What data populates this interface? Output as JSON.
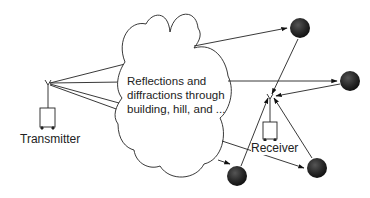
{
  "diagram": {
    "cloud_text": {
      "line1": "Reflections and",
      "line2": "diffractions through",
      "line3": "building, hill, and ..."
    },
    "transmitter_label": "Transmitter",
    "receiver_label": "Receiver",
    "nodes": [
      {
        "id": "transmitter",
        "label": "Transmitter",
        "type": "antenna-unit"
      },
      {
        "id": "cloud",
        "label": "Reflections and diffractions through building, hill, and ...",
        "type": "cloud"
      },
      {
        "id": "scatterer-1",
        "type": "dark-circle"
      },
      {
        "id": "scatterer-2",
        "type": "dark-circle"
      },
      {
        "id": "scatterer-3",
        "type": "dark-circle"
      },
      {
        "id": "scatterer-4",
        "type": "dark-circle"
      },
      {
        "id": "receiver",
        "label": "Receiver",
        "type": "antenna-unit"
      }
    ],
    "edges": [
      {
        "from": "transmitter",
        "to": "cloud",
        "count": 4
      },
      {
        "from": "cloud",
        "to": "scatterer-1",
        "arrow": true
      },
      {
        "from": "cloud",
        "to": "scatterer-2",
        "arrow": true
      },
      {
        "from": "cloud",
        "to": "scatterer-3",
        "arrow": true
      },
      {
        "from": "cloud",
        "to": "scatterer-4",
        "arrow": true
      },
      {
        "from": "scatterer-1",
        "to": "receiver",
        "arrow": true
      },
      {
        "from": "scatterer-2",
        "to": "receiver",
        "arrow": true
      },
      {
        "from": "scatterer-3",
        "to": "receiver",
        "arrow": true
      },
      {
        "from": "scatterer-4",
        "to": "receiver",
        "arrow": true
      }
    ],
    "colors": {
      "line": "#222222",
      "scatterer_fill": "#2a2a2a",
      "background": "#ffffff"
    }
  }
}
